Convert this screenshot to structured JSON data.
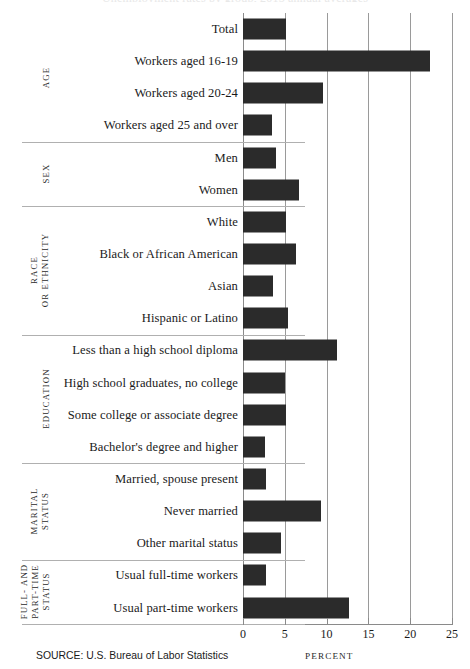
{
  "title": "Unemployment rates by group, 2015 annual averages",
  "source_note": "SOURCE: U.S. Bureau of Labor Statistics",
  "axis": {
    "xlabel": "PERCENT",
    "ticks": [
      "0",
      "5",
      "10",
      "15",
      "20",
      "25"
    ]
  },
  "groups": [
    {
      "label_lines": [
        "AGE"
      ],
      "rows": 4
    },
    {
      "label_lines": [
        "SEX"
      ],
      "rows": 2
    },
    {
      "label_lines": [
        "RACE",
        "OR ETHNICITY"
      ],
      "rows": 4
    },
    {
      "label_lines": [
        "EDUCATION"
      ],
      "rows": 4
    },
    {
      "label_lines": [
        "MARITAL",
        "STATUS"
      ],
      "rows": 3
    },
    {
      "label_lines": [
        "FULL- AND",
        "PART-TIME",
        "STATUS"
      ],
      "rows": 2
    }
  ],
  "chart_data": {
    "type": "bar",
    "orientation": "horizontal",
    "title": "Unemployment rates by group, 2015 annual averages",
    "xlabel": "PERCENT",
    "ylabel": "",
    "xlim": [
      0,
      25
    ],
    "xticks": [
      0,
      5,
      10,
      15,
      20,
      25
    ],
    "grid": true,
    "legend": "none",
    "bar_color": "#2b2b2b",
    "categories": [
      "Total",
      "Workers aged 16-19",
      "Workers aged 20-24",
      "Workers aged 25 and over",
      "Men",
      "Women",
      "White",
      "Black or African American",
      "Asian",
      "Hispanic or Latino",
      "Less than a high school diploma",
      "High school graduates, no college",
      "Some college or associate degree",
      "Bachelor's degree and higher",
      "Married, spouse present",
      "Never married",
      "Other marital status",
      "Usual full-time workers",
      "Usual part-time workers"
    ],
    "values": [
      5.1,
      22.4,
      9.6,
      3.5,
      4.0,
      6.7,
      5.2,
      6.3,
      3.6,
      5.4,
      11.3,
      5.0,
      5.1,
      2.6,
      2.8,
      9.3,
      4.6,
      2.8,
      12.7
    ],
    "group_labels": [
      "AGE",
      "SEX",
      "RACE OR ETHNICITY",
      "EDUCATION",
      "MARITAL STATUS",
      "FULL- AND PART-TIME STATUS"
    ],
    "group_row_counts": [
      4,
      2,
      4,
      4,
      3,
      2
    ],
    "source": "SOURCE: U.S. Bureau of Labor Statistics"
  }
}
